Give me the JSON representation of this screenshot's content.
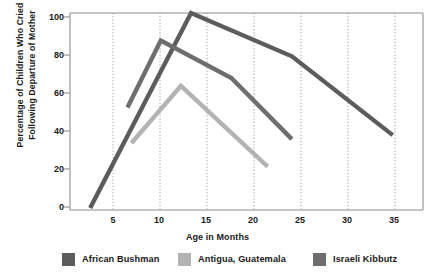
{
  "chart_data": {
    "type": "line",
    "title": "",
    "xlabel": "Age in Months",
    "ylabel": "Percentage of Children Who Cried Following Departure of Mother",
    "ylabel_line1": "Percentage of Children Who Cried",
    "ylabel_line2": "Following Departure of Mother",
    "xlim": [
      3,
      38
    ],
    "ylim": [
      0,
      100
    ],
    "xticks": [
      5,
      10,
      15,
      20,
      25,
      30,
      35
    ],
    "xtick_labels": [
      "5",
      "10",
      "15",
      "20",
      "25",
      "30",
      "35"
    ],
    "yticks": [
      0,
      20,
      40,
      60,
      80,
      100
    ],
    "ytick_labels": [
      "0",
      "20",
      "40",
      "60",
      "80",
      "100"
    ],
    "grid": "vertical-dotted",
    "legend_position": "bottom",
    "series": [
      {
        "name": "African Bushman",
        "color": "#5c5c5c",
        "points": [
          [
            5,
            1
          ],
          [
            15,
            100
          ],
          [
            25,
            78
          ],
          [
            35,
            38
          ]
        ]
      },
      {
        "name": "Antigua, Guatemala",
        "color": "#b3b3b3",
        "points": [
          [
            9.1,
            34
          ],
          [
            14,
            63
          ],
          [
            22.6,
            22
          ]
        ]
      },
      {
        "name": "Israeli Kibbutz",
        "color": "#6e6e6e",
        "points": [
          [
            8.7,
            52
          ],
          [
            12,
            86
          ],
          [
            19,
            67
          ],
          [
            25,
            36
          ]
        ]
      }
    ]
  },
  "legend": {
    "items": [
      {
        "label": "African Bushman",
        "color": "#5c5c5c"
      },
      {
        "label": "Antigua, Guatemala",
        "color": "#b3b3b3"
      },
      {
        "label": "Israeli Kibbutz",
        "color": "#6e6e6e"
      }
    ]
  },
  "colors": {
    "axis": "#8d8d8d",
    "grid": "#9a9a9a",
    "text": "#1a1a1a",
    "background": "#ffffff"
  }
}
